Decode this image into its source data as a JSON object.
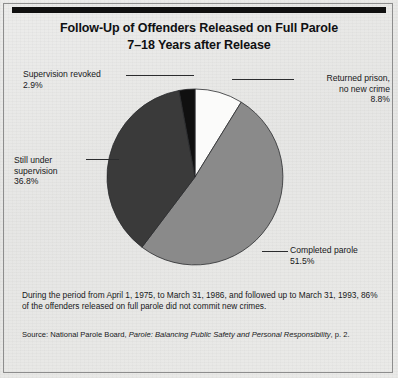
{
  "figure": {
    "title_line1": "Follow-Up of Offenders Released on Full Parole",
    "title_line2": "7–18 Years after Release",
    "note": "During the period from April 1, 1975, to March 31, 1986, and followed up to March 31, 1993, 86% of the offenders released on full parole did not commit new crimes.",
    "source_prefix": "Source: National Parole Board, ",
    "source_italic": "Parole: Balancing Public Safety and Personal Responsibility",
    "source_suffix": ", p. 2."
  },
  "labels": {
    "revoked": "Supervision revoked\n2.9%",
    "still_under": "Still under\nsupervision\n36.8%",
    "returned": "Returned prison,\nno new crime\n8.8%",
    "completed": "Completed parole\n51.5%"
  },
  "colors": {
    "background": "#e8e8e6",
    "frame": "#8d8d8d",
    "rule": "#101010",
    "text": "#17181a",
    "slice_white": "#fbfbfa",
    "slice_mid_gray": "#8a8a8a",
    "slice_dark_gray": "#3a3a3a",
    "slice_black": "#101010",
    "slice_outline": "#2b2c2e"
  },
  "chart_data": {
    "type": "pie",
    "title": "Follow-Up of Offenders Released on Full Parole 7–18 Years after Release",
    "categories": [
      "Returned prison, no new crime",
      "Completed parole",
      "Still under supervision",
      "Supervision revoked"
    ],
    "values": [
      8.8,
      51.5,
      36.8,
      2.9
    ],
    "value_labels": [
      "8.8%",
      "51.5%",
      "36.8%",
      "2.9%"
    ],
    "units": "percent",
    "slice_colors": [
      "#fbfbfa",
      "#8a8a8a",
      "#3a3a3a",
      "#101010"
    ],
    "start_angle_deg": 0,
    "direction": "clockwise",
    "legend": "callout-labels",
    "grid": false,
    "center_px": [
      195,
      177
    ],
    "radius_px": 88
  }
}
